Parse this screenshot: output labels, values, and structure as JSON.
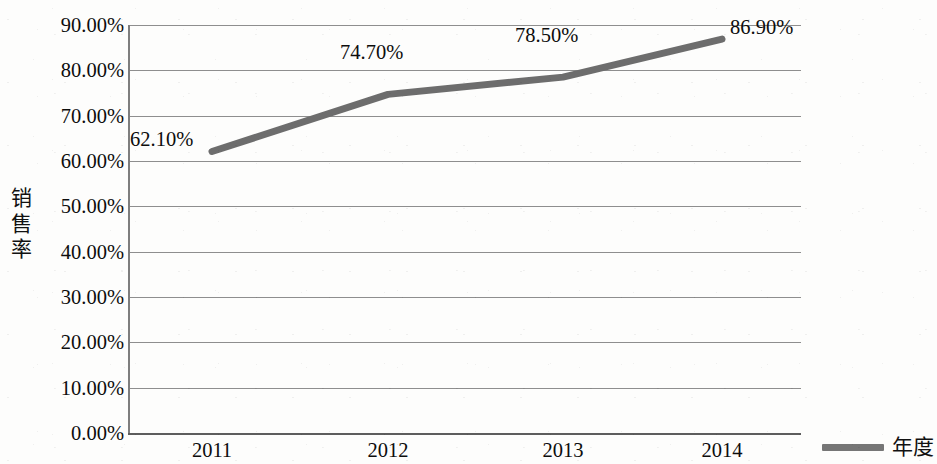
{
  "chart_data": {
    "type": "line",
    "title": "",
    "xlabel": "年度",
    "ylabel": "销售率",
    "categories": [
      "2011",
      "2012",
      "2013",
      "2014"
    ],
    "values": [
      62.1,
      74.7,
      78.5,
      86.9
    ],
    "point_labels": [
      "62.10%",
      "74.70%",
      "78.50%",
      "86.90%"
    ],
    "series": [
      {
        "name": "年度",
        "values": [
          62.1,
          74.7,
          78.5,
          86.9
        ],
        "color": "#6d6d6d"
      }
    ],
    "ylim": [
      0,
      90
    ],
    "ytick_values": [
      90,
      80,
      70,
      60,
      50,
      40,
      30,
      20,
      10,
      0
    ],
    "ytick_labels": [
      "90.00%",
      "80.00%",
      "70.00%",
      "60.00%",
      "50.00%",
      "40.00%",
      "30.00%",
      "20.00%",
      "10.00%",
      "0.00%"
    ],
    "grid": true,
    "legend_position": "bottom-right",
    "legend_entries": [
      "年度"
    ],
    "axis_color": "#7e7e7e",
    "grid_color": "#8e8e8e",
    "background": "#fdfdfc"
  },
  "axes": {
    "y_title_chars": [
      "销",
      "售",
      "率"
    ]
  },
  "legend": {
    "label": "年度",
    "swatch_color": "#767676"
  }
}
